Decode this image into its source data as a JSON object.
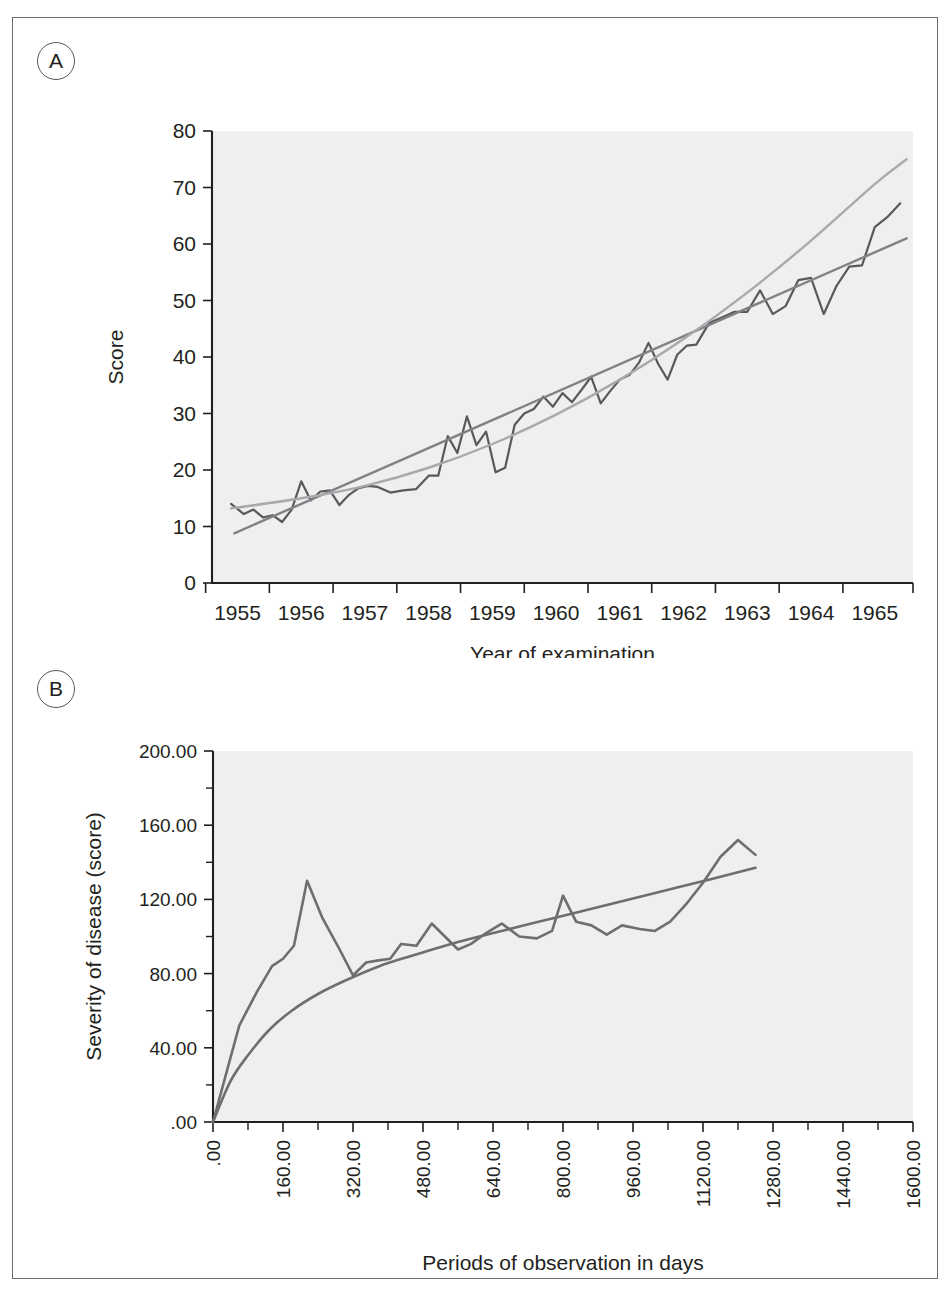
{
  "figure": {
    "panels": [
      {
        "badge": "A",
        "chart_data": {
          "type": "line",
          "title": "",
          "xlabel": "Year of examination",
          "ylabel": "Score",
          "xlim": [
            1954.6,
            1965.6
          ],
          "ylim": [
            0,
            80
          ],
          "grid": false,
          "legend": "none",
          "xticks": [
            1955,
            1956,
            1957,
            1958,
            1959,
            1960,
            1961,
            1962,
            1963,
            1964,
            1965
          ],
          "xticklabels": [
            "1955",
            "1956",
            "1957",
            "1958",
            "1959",
            "1960",
            "1961",
            "1962",
            "1963",
            "1964",
            "1965"
          ],
          "yticks": [
            0,
            10,
            20,
            30,
            40,
            50,
            60,
            70,
            80
          ],
          "yticklabels": [
            "0",
            "10",
            "20",
            "30",
            "40",
            "50",
            "60",
            "70",
            "80"
          ],
          "series": [
            {
              "name": "observed-score",
              "style": "jagged-line",
              "color": "#58595b",
              "x": [
                1954.9,
                1955.1,
                1955.25,
                1955.4,
                1955.55,
                1955.7,
                1955.85,
                1956.0,
                1956.15,
                1956.3,
                1956.45,
                1956.6,
                1956.75,
                1956.9,
                1957.05,
                1957.2,
                1957.4,
                1957.6,
                1957.8,
                1958.0,
                1958.15,
                1958.3,
                1958.45,
                1958.6,
                1958.75,
                1958.9,
                1959.05,
                1959.2,
                1959.35,
                1959.5,
                1959.65,
                1959.8,
                1959.95,
                1960.1,
                1960.25,
                1960.4,
                1960.55,
                1960.7,
                1960.85,
                1961.0,
                1961.15,
                1961.3,
                1961.45,
                1961.6,
                1961.75,
                1961.9,
                1962.05,
                1962.2,
                1962.4,
                1962.6,
                1962.8,
                1963.0,
                1963.2,
                1963.4,
                1963.6,
                1963.8,
                1964.0,
                1964.2,
                1964.4,
                1964.6,
                1964.8,
                1965.0,
                1965.2,
                1965.4
              ],
              "y": [
                14.0,
                12.2,
                13.0,
                11.6,
                12.0,
                10.8,
                13.0,
                18.0,
                14.6,
                16.2,
                16.4,
                13.8,
                15.6,
                16.8,
                17.2,
                17.0,
                16.0,
                16.4,
                16.6,
                19.0,
                19.0,
                26.0,
                23.0,
                29.5,
                24.4,
                26.8,
                19.6,
                20.4,
                28.0,
                30.0,
                30.8,
                33.0,
                31.2,
                33.6,
                32.0,
                34.2,
                36.5,
                31.8,
                34.0,
                36.0,
                36.8,
                39.0,
                42.5,
                38.8,
                36.0,
                40.4,
                42.0,
                42.2,
                46.0,
                47.0,
                48.0,
                48.0,
                51.8,
                47.6,
                49.0,
                53.6,
                54.0,
                47.6,
                52.6,
                56.0,
                56.2,
                63.0,
                64.8,
                67.2
              ]
            },
            {
              "name": "linear-trend",
              "style": "straight-line",
              "color": "#808285",
              "x": [
                1954.95,
                1965.5
              ],
              "y": [
                8.8,
                61.0
              ]
            },
            {
              "name": "curvilinear-trend",
              "style": "curve",
              "color": "#a7a9ac",
              "x": [
                1954.9,
                1956.0,
                1957.0,
                1958.0,
                1959.0,
                1960.0,
                1961.0,
                1962.0,
                1963.0,
                1964.0,
                1965.0,
                1965.5
              ],
              "y": [
                13.2,
                15.0,
                17.2,
                20.4,
                24.6,
                29.8,
                36.0,
                43.2,
                51.4,
                60.6,
                70.6,
                75.0
              ]
            }
          ]
        }
      },
      {
        "badge": "B",
        "chart_data": {
          "type": "line",
          "title": "",
          "xlabel": "Periods of observation in days",
          "ylabel": "Severity of disease (score)",
          "xlim": [
            0,
            1600
          ],
          "ylim": [
            0,
            200
          ],
          "grid": false,
          "legend": "none",
          "xticks": [
            0,
            160,
            320,
            480,
            640,
            800,
            960,
            1120,
            1280,
            1440,
            1600
          ],
          "xticklabels": [
            ".00",
            "160.00",
            "320.00",
            "480.00",
            "640.00",
            "800.00",
            "960.00",
            "1120.00",
            "1280.00",
            "1440.00",
            "1600.00"
          ],
          "xtick_rotation": 90,
          "yticks": [
            0,
            40,
            80,
            120,
            160,
            200
          ],
          "yticklabels": [
            ".00",
            "40.00",
            "80.00",
            "120.00",
            "160.00",
            "200.00"
          ],
          "yminorticks": [
            20,
            60,
            100,
            140,
            180
          ],
          "series": [
            {
              "name": "observed-severity",
              "style": "jagged-line",
              "color": "#6d6e70",
              "x": [
                0,
                60,
                100,
                135,
                160,
                185,
                215,
                250,
                285,
                320,
                350,
                375,
                405,
                430,
                465,
                500,
                530,
                560,
                590,
                625,
                660,
                700,
                740,
                775,
                800,
                830,
                865,
                900,
                935,
                975,
                1010,
                1045,
                1080,
                1120,
                1160,
                1200,
                1240
              ],
              "y": [
                0,
                52,
                70,
                84,
                88,
                95,
                130,
                110,
                95,
                79,
                86,
                87,
                88,
                96,
                95,
                107,
                100,
                93,
                96,
                102,
                107,
                100,
                99,
                103,
                122,
                108,
                106,
                101,
                106,
                104,
                103,
                108,
                117,
                129,
                143,
                152,
                144
              ]
            },
            {
              "name": "logarithmic-fit",
              "style": "curve",
              "color": "#6d6e70",
              "x": [
                0,
                40,
                80,
                130,
                180,
                240,
                300,
                380,
                460,
                560,
                660,
                780,
                900,
                1020,
                1140,
                1240
              ],
              "y": [
                0,
                22,
                36,
                50,
                60,
                69,
                76,
                84,
                90,
                97,
                103,
                110,
                117,
                124,
                131,
                137
              ]
            }
          ]
        }
      }
    ]
  }
}
